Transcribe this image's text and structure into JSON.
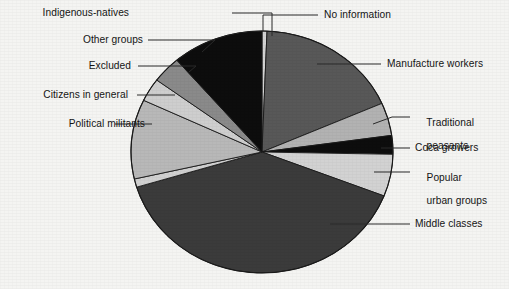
{
  "chart_data": {
    "type": "pie",
    "title": "",
    "subtitle": "",
    "xlabel": "",
    "ylabel": "",
    "legend_position": "callout-labels",
    "grid": false,
    "total_percent": 100,
    "center": {
      "x": 262,
      "y": 152
    },
    "radius": {
      "rx": 131,
      "ry": 121
    },
    "start_angle_deg": 0,
    "direction": "clockwise",
    "categories": [
      "No information",
      "Manufacture workers",
      "Traditional peasants",
      "Coca growers",
      "Popular urban groups",
      "Middle classes",
      "Political militants",
      "Citizens in general",
      "Excluded",
      "Other groups",
      "Indigenous-natives"
    ],
    "values": [
      0.6,
      17.8,
      4.4,
      2.5,
      5.6,
      39.4,
      1.1,
      10.6,
      3.1,
      3.6,
      11.3
    ],
    "slices": [
      {
        "label": "No information",
        "value": 0.6,
        "start_deg": 0.0,
        "end_deg": 2.2,
        "color": "#d4d4d4"
      },
      {
        "label": "Manufacture workers",
        "value": 17.8,
        "start_deg": 2.2,
        "end_deg": 66.3,
        "color": "#585858"
      },
      {
        "label": "Traditional peasants",
        "value": 4.4,
        "start_deg": 66.3,
        "end_deg": 82.1,
        "color": "#b2b2b2"
      },
      {
        "label": "Coca growers",
        "value": 2.5,
        "start_deg": 82.1,
        "end_deg": 91.1,
        "color": "#0d0d0d"
      },
      {
        "label": "Popular urban groups",
        "value": 5.6,
        "start_deg": 91.1,
        "end_deg": 111.3,
        "color": "#d2d2d2"
      },
      {
        "label": "Middle classes",
        "value": 39.4,
        "start_deg": 111.3,
        "end_deg": 253.1,
        "color": "#3b3b3b"
      },
      {
        "label": "Political militants",
        "value": 1.1,
        "start_deg": 253.1,
        "end_deg": 257.1,
        "color": "#d0d0d0"
      },
      {
        "label": "Citizens in general",
        "value": 10.6,
        "start_deg": 257.1,
        "end_deg": 295.3,
        "color": "#b8b8b8"
      },
      {
        "label": "Excluded",
        "value": 3.1,
        "start_deg": 295.3,
        "end_deg": 306.5,
        "color": "#cecece"
      },
      {
        "label": "Other groups",
        "value": 3.6,
        "start_deg": 306.5,
        "end_deg": 319.4,
        "color": "#8a8a8a"
      },
      {
        "label": "Indigenous-natives",
        "value": 11.3,
        "start_deg": 319.4,
        "end_deg": 360.0,
        "color": "#0d0d0d"
      }
    ]
  },
  "labels": {
    "indigenous_natives": "Indigenous-natives",
    "other_groups": "Other groups",
    "excluded": "Excluded",
    "citizens_in_general": "Citizens in general",
    "political_militants": "Political militants",
    "no_information": "No information",
    "manufacture_workers": "Manufacture workers",
    "traditional_peasants_l1": "Traditional",
    "traditional_peasants_l2": "peasants",
    "coca_growers": "Coca growers",
    "popular_urban_l1": "Popular",
    "popular_urban_l2": "urban groups",
    "middle_classes": "Middle classes"
  },
  "colors": {
    "background": "#f4f4f2",
    "outline": "#1a1a1a",
    "leader": "#2a2a2a",
    "text": "#141414"
  }
}
